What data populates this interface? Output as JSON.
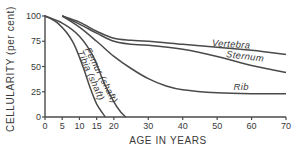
{
  "chart_data": {
    "type": "line",
    "title": "",
    "xlabel": "AGE IN YEARS",
    "ylabel": "CELLULARITY (per cent)",
    "xlim": [
      0,
      70
    ],
    "ylim": [
      0,
      100
    ],
    "grid": false,
    "legend": "inline labels on curves",
    "x_ticks": [
      0,
      5,
      10,
      15,
      20,
      30,
      40,
      50,
      60,
      70
    ],
    "y_ticks": [
      0,
      25,
      50,
      75,
      100
    ],
    "series": [
      {
        "name": "Vertebra",
        "label_pos": [
          54,
          69
        ],
        "label_rotate": 4,
        "points": [
          [
            5,
            100
          ],
          [
            10,
            94
          ],
          [
            15,
            85
          ],
          [
            20,
            78
          ],
          [
            25,
            76
          ],
          [
            30,
            75
          ],
          [
            40,
            72
          ],
          [
            50,
            69
          ],
          [
            60,
            66
          ],
          [
            70,
            62
          ]
        ]
      },
      {
        "name": "Sternum",
        "label_pos": [
          58,
          57
        ],
        "label_rotate": 7,
        "points": [
          [
            5,
            100
          ],
          [
            10,
            92
          ],
          [
            15,
            83
          ],
          [
            20,
            75
          ],
          [
            25,
            72
          ],
          [
            30,
            71
          ],
          [
            40,
            67
          ],
          [
            50,
            60
          ],
          [
            60,
            51
          ],
          [
            70,
            44
          ]
        ]
      },
      {
        "name": "Rib",
        "label_pos": [
          57,
          27
        ],
        "label_rotate": 0,
        "points": [
          [
            5,
            100
          ],
          [
            10,
            89
          ],
          [
            15,
            75
          ],
          [
            20,
            60
          ],
          [
            25,
            48
          ],
          [
            30,
            38
          ],
          [
            35,
            31
          ],
          [
            40,
            27
          ],
          [
            50,
            24
          ],
          [
            60,
            23
          ],
          [
            70,
            23
          ]
        ]
      },
      {
        "name": "Femur (shaft)",
        "label_pos": [
          15.5,
          40
        ],
        "label_rotate": 63,
        "points": [
          [
            0,
            100
          ],
          [
            5,
            93
          ],
          [
            10,
            80
          ],
          [
            14,
            60
          ],
          [
            17,
            35
          ],
          [
            20,
            15
          ],
          [
            22,
            5
          ],
          [
            23.5,
            0
          ]
        ]
      },
      {
        "name": "Tibia (shaft)",
        "label_pos": [
          12.5,
          40
        ],
        "label_rotate": 66,
        "points": [
          [
            0,
            100
          ],
          [
            4,
            92
          ],
          [
            8,
            75
          ],
          [
            11,
            50
          ],
          [
            13,
            30
          ],
          [
            15,
            13
          ],
          [
            17.5,
            0
          ]
        ]
      }
    ]
  }
}
